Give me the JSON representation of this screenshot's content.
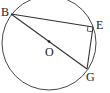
{
  "diagram": {
    "type": "geometry",
    "circle": {
      "center_label": "O",
      "cx": 49,
      "cy": 43,
      "r": 47
    },
    "points": [
      {
        "label": "B",
        "x": 11,
        "y": 14
      },
      {
        "label": "E",
        "x": 93,
        "y": 27
      },
      {
        "label": "G",
        "x": 87,
        "y": 69
      },
      {
        "label": "O",
        "x": 49,
        "y": 41
      }
    ],
    "segments": [
      [
        "B",
        "E"
      ],
      [
        "E",
        "G"
      ],
      [
        "B",
        "G"
      ]
    ],
    "right_angle_at": "E",
    "labels": {
      "B": "B",
      "E": "E",
      "G": "G",
      "O": "O"
    },
    "colors": {
      "stroke": "#333333",
      "text": "#222222"
    }
  }
}
